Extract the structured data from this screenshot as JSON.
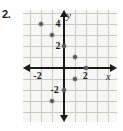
{
  "problem": {
    "number": "2."
  },
  "chart_data": {
    "type": "scatter",
    "title": "",
    "xlabel": "x",
    "ylabel": "y",
    "grid": true,
    "legend": null,
    "xlim": [
      -4,
      4
    ],
    "ylim": [
      -4,
      5
    ],
    "xticks": [
      -2,
      2
    ],
    "yticks": [
      -2,
      2,
      4
    ],
    "xtick_labels": [
      "-2",
      "2"
    ],
    "ytick_labels": [
      "-2",
      "2",
      "4"
    ],
    "grid_step": 1,
    "points": [
      {
        "x": -2,
        "y": 4
      },
      {
        "x": -1,
        "y": 3
      },
      {
        "x": 0,
        "y": 2
      },
      {
        "x": 1,
        "y": 1
      },
      {
        "x": 2,
        "y": 0
      },
      {
        "x": 1,
        "y": -1
      },
      {
        "x": 0,
        "y": -2
      },
      {
        "x": -1,
        "y": -3
      }
    ],
    "axis_labels": {
      "x": "x",
      "y": "y"
    }
  },
  "colors": {
    "point": "#5a5a5e",
    "axis": "#1a1a1a",
    "grid": "#c9c9c7",
    "plot_background": "#f7f7f5"
  }
}
